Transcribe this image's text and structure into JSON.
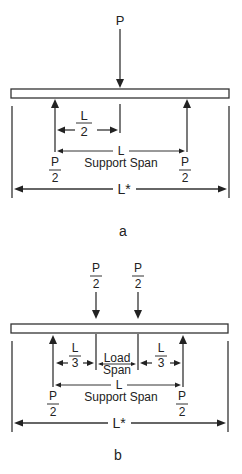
{
  "figure_a": {
    "caption": "a",
    "load_label": "P",
    "half_span_num": "L",
    "half_span_den": "2",
    "support_span_length": "L",
    "support_span_label": "Support Span",
    "left_reaction_num": "P",
    "left_reaction_den": "2",
    "right_reaction_num": "P",
    "right_reaction_den": "2",
    "total_length": "L*"
  },
  "figure_b": {
    "caption": "b",
    "left_load_num": "P",
    "left_load_den": "2",
    "right_load_num": "P",
    "right_load_den": "2",
    "left_third_num": "L",
    "left_third_den": "3",
    "right_third_num": "L",
    "right_third_den": "3",
    "load_span_line1": "Load",
    "load_span_line2": "Span",
    "support_span_length": "L",
    "support_span_label": "Support Span",
    "left_reaction_num": "P",
    "left_reaction_den": "2",
    "right_reaction_num": "P",
    "right_reaction_den": "2",
    "total_length": "L*"
  }
}
